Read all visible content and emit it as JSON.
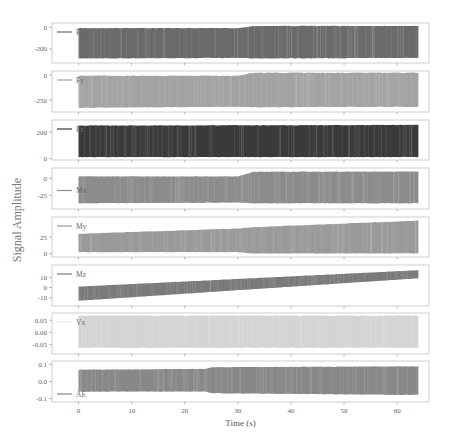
{
  "chart_data": {
    "type": "line",
    "title": "",
    "xlabel": "Time (s)",
    "ylabel": "Signal Amplitude",
    "xlim": [
      -5,
      66
    ],
    "xticks": [
      0,
      10,
      20,
      30,
      40,
      50,
      60
    ],
    "grid": false,
    "legend_position": "upper left (inside each panel)",
    "panels": [
      {
        "name": "Fx",
        "color": "#6a6a6a",
        "legend_loc": "top",
        "ylim": [
          -330,
          40
        ],
        "yticks": [
          0,
          -200
        ],
        "ytick_labels": [
          "0",
          "-200"
        ],
        "envelope": {
          "t": [
            0,
            30,
            33,
            64
          ],
          "upper": [
            -5,
            -5,
            15,
            15
          ],
          "lower": [
            -290,
            -285,
            -290,
            -285
          ]
        }
      },
      {
        "name": "Fy",
        "color": "#a3a3a3",
        "legend_loc": "top",
        "ylim": [
          -370,
          40
        ],
        "yticks": [
          0,
          -250
        ],
        "ytick_labels": [
          "0",
          "-250"
        ],
        "envelope": {
          "t": [
            0,
            30,
            33,
            64
          ],
          "upper": [
            -5,
            -5,
            25,
            25
          ],
          "lower": [
            -330,
            -320,
            -325,
            -320
          ]
        }
      },
      {
        "name": "Fz",
        "color": "#3a3a3a",
        "legend_loc": "top",
        "ylim": [
          -10,
          290
        ],
        "yticks": [
          200,
          0
        ],
        "ytick_labels": [
          "200",
          "0"
        ],
        "envelope": {
          "t": [
            0,
            30,
            64
          ],
          "upper": [
            250,
            252,
            255
          ],
          "lower": [
            10,
            10,
            10
          ]
        }
      },
      {
        "name": "Mx",
        "color": "#8c8c8c",
        "legend_loc": "middle",
        "ylim": [
          -45,
          15
        ],
        "yticks": [
          0,
          -25
        ],
        "ytick_labels": [
          "0",
          "-25"
        ],
        "envelope": {
          "t": [
            0,
            30,
            33,
            64
          ],
          "upper": [
            3,
            3,
            10,
            10
          ],
          "lower": [
            -37,
            -36,
            -37,
            -37
          ]
        }
      },
      {
        "name": "My",
        "color": "#9a9a9a",
        "legend_loc": "top",
        "ylim": [
          -5,
          55
        ],
        "yticks": [
          25,
          0
        ],
        "ytick_labels": [
          "25",
          "0"
        ],
        "envelope": {
          "t": [
            0,
            30,
            33,
            64
          ],
          "upper": [
            30,
            38,
            40,
            50
          ],
          "lower": [
            2,
            2,
            0,
            0
          ]
        }
      },
      {
        "name": "Mz",
        "color": "#7a7a7a",
        "legend_loc": "top",
        "ylim": [
          -18,
          22
        ],
        "yticks": [
          10,
          0,
          -10
        ],
        "ytick_labels": [
          "10",
          "0",
          "-10"
        ],
        "envelope": {
          "t": [
            0,
            64
          ],
          "upper": [
            1,
            17
          ],
          "lower": [
            -13,
            9
          ]
        }
      },
      {
        "name": "Vx",
        "color": "#d4d4d4",
        "legend_loc": "top",
        "ylim": [
          -0.09,
          0.08
        ],
        "yticks": [
          0.05,
          0.0,
          -0.05
        ],
        "ytick_labels": [
          "0.05",
          "0.00",
          "-0.05"
        ],
        "envelope": {
          "t": [
            0,
            64
          ],
          "upper": [
            0.07,
            0.07
          ],
          "lower": [
            -0.065,
            -0.065
          ]
        }
      },
      {
        "name": "AE",
        "color": "#888888",
        "legend_loc": "bottom",
        "ylim": [
          -0.12,
          0.12
        ],
        "yticks": [
          0.1,
          0.0,
          -0.1
        ],
        "ytick_labels": [
          "0.1",
          "0.0",
          "-0.1"
        ],
        "envelope": {
          "t": [
            0,
            24,
            25,
            64
          ],
          "upper": [
            0.07,
            0.075,
            0.085,
            0.09
          ],
          "lower": [
            -0.06,
            -0.06,
            -0.07,
            -0.08
          ]
        }
      }
    ]
  },
  "figure": {
    "xlabel": "Time (s)",
    "ylabel": "Signal Amplitude"
  }
}
